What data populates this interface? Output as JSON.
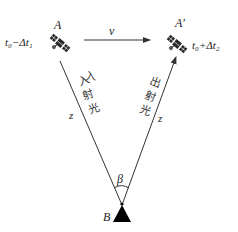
{
  "diagram": {
    "type": "satellite-ground-station-geometry",
    "nodes": {
      "satellite_start": {
        "label": "A",
        "time_label": "t₀−Δt₁"
      },
      "satellite_end": {
        "label": "A′",
        "time_label": "t₀+Δt₂"
      },
      "ground_station": {
        "label": "B"
      }
    },
    "velocity_label": "v",
    "incident_path": {
      "label": "入射光",
      "chars": [
        "入",
        "射",
        "光"
      ],
      "distance_label": "z"
    },
    "outgoing_path": {
      "label": "出射光",
      "chars": [
        "出",
        "射",
        "光"
      ],
      "distance_label": "z"
    },
    "angle_label": "β"
  },
  "colors": {
    "line": "#333333",
    "satellite": "#2a2a2a",
    "ground_station": "#000000",
    "text": "#222222"
  }
}
